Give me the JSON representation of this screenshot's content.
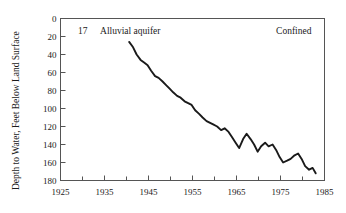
{
  "chart_data": {
    "type": "line",
    "title": "",
    "xlabel": "",
    "ylabel": "Depth to Water, Feet Below Land Surface",
    "xlim": [
      1925,
      1985
    ],
    "ylim": [
      0,
      180
    ],
    "y_axis_inverted": true,
    "grid": false,
    "legend_position": "none",
    "xticks": [
      1925,
      1935,
      1945,
      1955,
      1965,
      1975,
      1985
    ],
    "xtick_labels": [
      "1925",
      "1935",
      "1945",
      "1955",
      "1965",
      "1975",
      "1985"
    ],
    "xminor_ticks": [
      1930,
      1940,
      1950,
      1960,
      1970,
      1980
    ],
    "yticks": [
      0,
      20,
      40,
      60,
      80,
      100,
      120,
      140,
      160,
      180
    ],
    "ytick_labels": [
      "0",
      "20",
      "40",
      "60",
      "80",
      "100",
      "120",
      "140",
      "160",
      "180"
    ],
    "annotations": [
      {
        "name": "well-number",
        "text": "17",
        "x": 1929,
        "y": 14
      },
      {
        "name": "aquifer-type",
        "text": "Alluvial aquifer",
        "x": 1934,
        "y": 14
      },
      {
        "name": "confinement",
        "text": "Confined",
        "x": 1974,
        "y": 14
      }
    ],
    "series": [
      {
        "name": "Depth to water",
        "color": "#1a1a1a",
        "x": [
          1940.6,
          1941.5,
          1942.3,
          1943.2,
          1944.0,
          1944.8,
          1945.6,
          1946.5,
          1947.3,
          1948.2,
          1949.0,
          1949.8,
          1950.6,
          1951.5,
          1952.3,
          1953.2,
          1954.0,
          1954.8,
          1955.6,
          1956.5,
          1957.3,
          1958.2,
          1959.0,
          1959.8,
          1960.6,
          1961.5,
          1962.3,
          1963.2,
          1964.0,
          1964.8,
          1965.6,
          1966.5,
          1967.3,
          1968.2,
          1969.0,
          1969.8,
          1970.6,
          1971.5,
          1972.3,
          1973.2,
          1974.0,
          1974.8,
          1975.6,
          1976.5,
          1977.3,
          1978.2,
          1979.0,
          1979.8,
          1980.6,
          1981.5,
          1982.3,
          1983.0
        ],
        "values": [
          26,
          32,
          40,
          46,
          49,
          52,
          58,
          64,
          66,
          70,
          74,
          78,
          82,
          86,
          88,
          92,
          94,
          96,
          102,
          106,
          110,
          114,
          116,
          118,
          120,
          124,
          122,
          126,
          132,
          138,
          144,
          134,
          128,
          134,
          140,
          148,
          142,
          138,
          142,
          140,
          146,
          154,
          160,
          158,
          156,
          152,
          150,
          156,
          164,
          168,
          166,
          172
        ]
      }
    ]
  },
  "labels": {
    "ylabel": "Depth to Water, Feet Below Land Surface"
  }
}
